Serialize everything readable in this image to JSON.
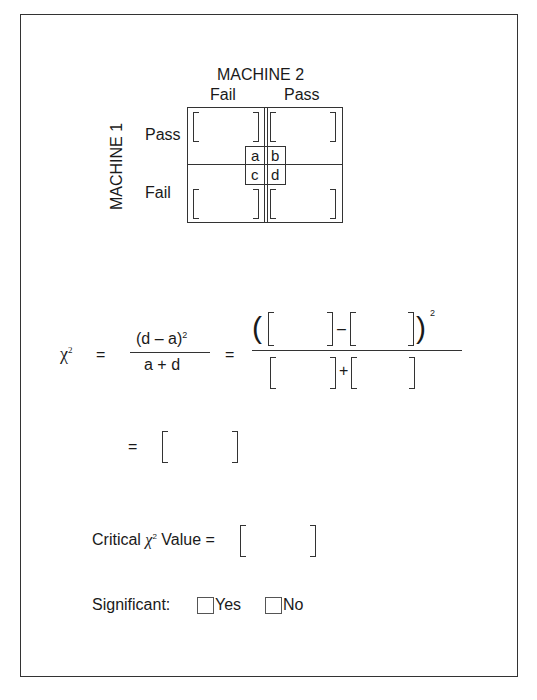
{
  "table": {
    "column_header": "MACHINE 2",
    "row_header": "MACHINE 1",
    "columns": [
      "Fail",
      "Pass"
    ],
    "rows": [
      "Pass",
      "Fail"
    ],
    "cell_labels": [
      "a",
      "b",
      "c",
      "d"
    ],
    "cells": [
      {
        "row": "Pass",
        "col": "Fail",
        "label": "a",
        "value": ""
      },
      {
        "row": "Pass",
        "col": "Pass",
        "label": "b",
        "value": ""
      },
      {
        "row": "Fail",
        "col": "Fail",
        "label": "c",
        "value": ""
      },
      {
        "row": "Fail",
        "col": "Pass",
        "label": "d",
        "value": ""
      }
    ]
  },
  "formula": {
    "chi": "χ",
    "sup2": "2",
    "equals": "=",
    "numerator": "(d – a)",
    "denominator": "a + d",
    "minus": "–",
    "plus": "+",
    "num_d_value": "",
    "num_a_value": "",
    "den_a_value": "",
    "den_d_value": "",
    "result_value": ""
  },
  "critical": {
    "label_prefix": "Critical ",
    "chi": "χ",
    "sup2": "2",
    "label_suffix": " Value =",
    "value": ""
  },
  "significance": {
    "label": "Significant:",
    "options": [
      {
        "label": "Yes",
        "checked": false
      },
      {
        "label": "No",
        "checked": false
      }
    ]
  }
}
